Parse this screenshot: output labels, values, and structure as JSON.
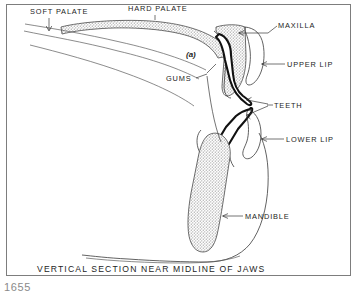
{
  "figure": {
    "number": "1655",
    "caption": "VERTICAL SECTION NEAR MIDLINE OF JAWS",
    "marker_a": "(a)"
  },
  "labels": {
    "soft_palate": "SOFT PALATE",
    "hard_palate": "HARD PALATE",
    "maxilla": "MAXILLA",
    "upper_lip": "UPPER LIP",
    "teeth": "TEETH",
    "gums": "GUMS",
    "lower_lip": "LOWER LIP",
    "mandible": "MANDIBLE"
  },
  "colors": {
    "background": "#ffffff",
    "ink": "#1d1d1d",
    "outline": "#3a3a3a",
    "tooth_outline": "#111111",
    "bone_fill": "#c9c9c9",
    "frame": "#7d7d7d",
    "figure_number": "#8a8a8a"
  }
}
